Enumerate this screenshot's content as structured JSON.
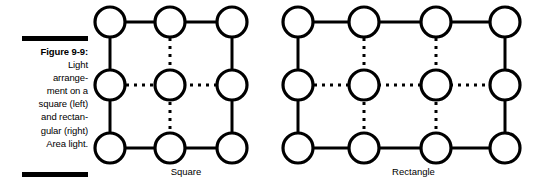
{
  "figure": {
    "label": "Figure 9-9:",
    "caption_lines": [
      "Light",
      "arrange-",
      "ment on a",
      "square (left)",
      "and rectan-",
      "gular (right)",
      "Area light."
    ],
    "rule_color": "#000000"
  },
  "diagrams": [
    {
      "name": "square",
      "caption": "Square",
      "type": "light-array-grid",
      "columns": 3,
      "rows": 3,
      "circle_radius": 15,
      "stroke_width": 3,
      "stroke_color": "#000000",
      "fill_color": "#ffffff",
      "col_x": [
        18,
        78,
        140
      ],
      "row_y": [
        22,
        85,
        148
      ],
      "solid_edges": "perimeter",
      "dotted_edges": "center-cross"
    },
    {
      "name": "rectangle",
      "caption": "Rectangle",
      "type": "light-array-grid",
      "columns": 4,
      "rows": 3,
      "circle_radius": 15,
      "stroke_width": 3,
      "stroke_color": "#000000",
      "fill_color": "#ffffff",
      "col_x": [
        18,
        84,
        156,
        225
      ],
      "row_y": [
        22,
        85,
        148
      ],
      "solid_edges": "perimeter",
      "dotted_edges": "interior"
    }
  ],
  "colors": {
    "background": "#ffffff",
    "ink": "#000000"
  }
}
